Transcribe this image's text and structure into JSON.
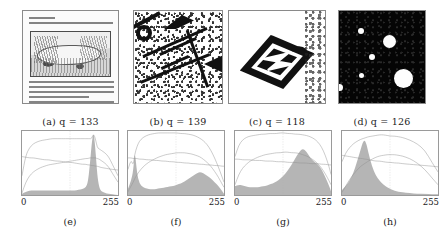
{
  "figure": {
    "axis_max_label": "255",
    "axis_min_label": "0"
  },
  "image_panels": [
    {
      "id": "a",
      "caption": "(a)  q = 133",
      "label": "(a)",
      "symbol": "q",
      "equals": "=",
      "q_value": "133",
      "content_name": "old-printed-page-with-engraving"
    },
    {
      "id": "b",
      "caption": "(b)  q = 139",
      "label": "(b)",
      "symbol": "q",
      "equals": "=",
      "q_value": "139",
      "content_name": "noisy-binarized-label-scan"
    },
    {
      "id": "c",
      "caption": "(c)  q = 118",
      "label": "(c)",
      "symbol": "q",
      "equals": "=",
      "q_value": "118",
      "content_name": "diamond-logo-on-white"
    },
    {
      "id": "d",
      "caption": "(d)  q = 126",
      "label": "(d)",
      "symbol": "q",
      "equals": "=",
      "q_value": "126",
      "content_name": "white-blobs-on-dark-background"
    }
  ],
  "hist_panels": [
    {
      "id": "e",
      "caption": "(e)",
      "x_min": "0",
      "x_max": "255"
    },
    {
      "id": "f",
      "caption": "(f)",
      "x_min": "0",
      "x_max": "255"
    },
    {
      "id": "g",
      "caption": "(g)",
      "x_min": "0",
      "x_max": "255"
    },
    {
      "id": "h",
      "caption": "(h)",
      "x_min": "0",
      "x_max": "255"
    }
  ],
  "colors": {
    "histogram_fill": "#a8a8a8",
    "curve_stroke": "#8e8e8e",
    "frame": "#9a9a9a",
    "grid": "#cfcfcf",
    "text": "#222222",
    "page_background": "#ffffff"
  },
  "chart_data": [
    {
      "type": "area",
      "id": "e",
      "title": "(e)",
      "xlabel": "",
      "ylabel": "",
      "xlim": [
        0,
        255
      ],
      "ylim": [
        0,
        1
      ],
      "grid": true,
      "legend": "none",
      "notes": "Gray-level histogram of panel (a): low flat background with a single very tall narrow spike near 190.",
      "x": [
        0,
        10,
        20,
        30,
        40,
        50,
        60,
        70,
        80,
        90,
        100,
        110,
        120,
        130,
        140,
        150,
        160,
        170,
        175,
        180,
        185,
        190,
        195,
        200,
        205,
        210,
        220,
        230,
        240,
        255
      ],
      "series": [
        {
          "name": "histogram",
          "values": [
            0.02,
            0.05,
            0.07,
            0.07,
            0.07,
            0.07,
            0.07,
            0.07,
            0.07,
            0.07,
            0.07,
            0.07,
            0.07,
            0.07,
            0.07,
            0.08,
            0.09,
            0.12,
            0.2,
            0.45,
            0.8,
            1.0,
            0.72,
            0.3,
            0.12,
            0.06,
            0.03,
            0.02,
            0.01,
            0.0
          ]
        },
        {
          "name": "upper-curve",
          "values": [
            0.3,
            0.62,
            0.74,
            0.8,
            0.83,
            0.85,
            0.86,
            0.87,
            0.88,
            0.88,
            0.88,
            0.88,
            0.88,
            0.88,
            0.88,
            0.88,
            0.88,
            0.88,
            0.88,
            0.88,
            0.88,
            0.96,
            0.88,
            0.74,
            0.72,
            0.7,
            0.66,
            0.6,
            0.48,
            0.3
          ]
        },
        {
          "name": "rising-curve",
          "values": [
            0.03,
            0.2,
            0.3,
            0.36,
            0.4,
            0.43,
            0.45,
            0.47,
            0.48,
            0.49,
            0.5,
            0.51,
            0.52,
            0.53,
            0.54,
            0.55,
            0.56,
            0.57,
            0.57,
            0.58,
            0.58,
            0.58,
            0.58,
            0.57,
            0.56,
            0.54,
            0.5,
            0.44,
            0.34,
            0.2
          ]
        },
        {
          "name": "falling-line",
          "values": [
            0.6,
            0.59,
            0.58,
            0.58,
            0.57,
            0.56,
            0.55,
            0.55,
            0.54,
            0.53,
            0.53,
            0.52,
            0.51,
            0.51,
            0.5,
            0.49,
            0.48,
            0.48,
            0.47,
            0.47,
            0.46,
            0.46,
            0.45,
            0.45,
            0.44,
            0.43,
            0.42,
            0.41,
            0.4,
            0.39
          ]
        }
      ]
    },
    {
      "type": "area",
      "id": "f",
      "title": "(f)",
      "xlabel": "",
      "ylabel": "",
      "xlim": [
        0,
        255
      ],
      "ylim": [
        0,
        1
      ],
      "grid": true,
      "legend": "none",
      "notes": "Gray-level histogram of panel (b): sharp dark spike near 18 plus a broad bump centered around 190.",
      "x": [
        0,
        8,
        14,
        18,
        24,
        30,
        40,
        50,
        60,
        70,
        80,
        90,
        100,
        110,
        120,
        130,
        140,
        150,
        160,
        170,
        180,
        190,
        200,
        210,
        220,
        230,
        240,
        250,
        255
      ],
      "series": [
        {
          "name": "histogram",
          "values": [
            0.1,
            0.22,
            0.38,
            0.7,
            0.34,
            0.18,
            0.12,
            0.1,
            0.09,
            0.09,
            0.1,
            0.11,
            0.12,
            0.13,
            0.14,
            0.16,
            0.18,
            0.21,
            0.25,
            0.29,
            0.33,
            0.36,
            0.34,
            0.3,
            0.26,
            0.2,
            0.14,
            0.06,
            0.02
          ]
        },
        {
          "name": "upper-curve",
          "values": [
            0.4,
            0.55,
            0.46,
            0.64,
            0.76,
            0.84,
            0.9,
            0.93,
            0.95,
            0.96,
            0.97,
            0.97,
            0.97,
            0.97,
            0.97,
            0.97,
            0.96,
            0.96,
            0.95,
            0.94,
            0.92,
            0.89,
            0.85,
            0.79,
            0.7,
            0.58,
            0.44,
            0.28,
            0.2
          ]
        },
        {
          "name": "rising-curve",
          "values": [
            0.05,
            0.14,
            0.2,
            0.26,
            0.32,
            0.37,
            0.44,
            0.49,
            0.53,
            0.56,
            0.59,
            0.61,
            0.63,
            0.64,
            0.65,
            0.66,
            0.66,
            0.66,
            0.65,
            0.64,
            0.62,
            0.6,
            0.56,
            0.51,
            0.45,
            0.37,
            0.28,
            0.17,
            0.12
          ]
        },
        {
          "name": "falling-line",
          "values": [
            0.58,
            0.58,
            0.57,
            0.57,
            0.57,
            0.56,
            0.56,
            0.55,
            0.55,
            0.54,
            0.54,
            0.53,
            0.53,
            0.52,
            0.52,
            0.51,
            0.51,
            0.5,
            0.5,
            0.49,
            0.49,
            0.48,
            0.48,
            0.47,
            0.47,
            0.46,
            0.46,
            0.45,
            0.45
          ]
        }
      ]
    },
    {
      "type": "area",
      "id": "g",
      "title": "(g)",
      "xlabel": "",
      "ylabel": "",
      "xlim": [
        0,
        255
      ],
      "ylim": [
        0,
        1
      ],
      "grid": true,
      "legend": "none",
      "notes": "Gray-level histogram of panel (c): low left plateau rising to a broad peak near 185.",
      "x": [
        0,
        10,
        20,
        30,
        40,
        50,
        60,
        70,
        80,
        90,
        100,
        110,
        120,
        130,
        140,
        150,
        160,
        170,
        180,
        190,
        200,
        210,
        220,
        230,
        240,
        250,
        255
      ],
      "series": [
        {
          "name": "histogram",
          "values": [
            0.14,
            0.16,
            0.15,
            0.13,
            0.12,
            0.12,
            0.12,
            0.13,
            0.14,
            0.16,
            0.18,
            0.21,
            0.25,
            0.31,
            0.38,
            0.47,
            0.57,
            0.67,
            0.73,
            0.68,
            0.58,
            0.52,
            0.48,
            0.4,
            0.28,
            0.14,
            0.06
          ]
        },
        {
          "name": "upper-curve",
          "values": [
            0.6,
            0.78,
            0.86,
            0.9,
            0.92,
            0.93,
            0.94,
            0.95,
            0.95,
            0.96,
            0.96,
            0.96,
            0.97,
            0.97,
            0.96,
            0.96,
            0.95,
            0.95,
            0.94,
            0.93,
            0.91,
            0.88,
            0.83,
            0.75,
            0.62,
            0.44,
            0.32
          ]
        },
        {
          "name": "rising-curve",
          "values": [
            0.16,
            0.32,
            0.42,
            0.48,
            0.53,
            0.56,
            0.59,
            0.61,
            0.63,
            0.64,
            0.65,
            0.66,
            0.66,
            0.67,
            0.67,
            0.66,
            0.66,
            0.65,
            0.63,
            0.61,
            0.58,
            0.54,
            0.49,
            0.42,
            0.33,
            0.22,
            0.16
          ]
        },
        {
          "name": "falling-line",
          "values": [
            0.56,
            0.56,
            0.55,
            0.55,
            0.55,
            0.54,
            0.54,
            0.54,
            0.53,
            0.53,
            0.53,
            0.52,
            0.52,
            0.52,
            0.51,
            0.51,
            0.51,
            0.5,
            0.5,
            0.5,
            0.49,
            0.49,
            0.49,
            0.48,
            0.48,
            0.47,
            0.47
          ]
        }
      ]
    },
    {
      "type": "area",
      "id": "h",
      "title": "(h)",
      "xlabel": "",
      "ylabel": "",
      "xlim": [
        0,
        255
      ],
      "ylim": [
        0,
        1
      ],
      "grid": true,
      "legend": "none",
      "notes": "Gray-level histogram of panel (d): single strong peak near 60 falling off to near zero above 150.",
      "x": [
        0,
        10,
        20,
        30,
        40,
        50,
        55,
        60,
        65,
        70,
        80,
        90,
        100,
        110,
        120,
        130,
        140,
        150,
        160,
        180,
        200,
        220,
        240,
        255
      ],
      "series": [
        {
          "name": "histogram",
          "values": [
            0.08,
            0.14,
            0.22,
            0.34,
            0.52,
            0.72,
            0.82,
            0.86,
            0.8,
            0.66,
            0.44,
            0.3,
            0.22,
            0.16,
            0.12,
            0.09,
            0.07,
            0.05,
            0.04,
            0.03,
            0.02,
            0.02,
            0.01,
            0.01
          ]
        },
        {
          "name": "upper-curve",
          "values": [
            0.52,
            0.66,
            0.74,
            0.8,
            0.84,
            0.87,
            0.88,
            0.89,
            0.9,
            0.91,
            0.92,
            0.93,
            0.94,
            0.94,
            0.93,
            0.92,
            0.92,
            0.91,
            0.9,
            0.86,
            0.8,
            0.7,
            0.5,
            0.36
          ]
        },
        {
          "name": "rising-curve",
          "values": [
            0.04,
            0.14,
            0.24,
            0.32,
            0.39,
            0.45,
            0.47,
            0.49,
            0.51,
            0.53,
            0.56,
            0.59,
            0.61,
            0.62,
            0.63,
            0.63,
            0.63,
            0.62,
            0.61,
            0.57,
            0.5,
            0.4,
            0.26,
            0.16
          ]
        },
        {
          "name": "falling-line",
          "values": [
            0.62,
            0.61,
            0.6,
            0.59,
            0.58,
            0.57,
            0.57,
            0.56,
            0.56,
            0.55,
            0.54,
            0.53,
            0.53,
            0.52,
            0.51,
            0.51,
            0.5,
            0.5,
            0.49,
            0.48,
            0.47,
            0.46,
            0.45,
            0.44
          ]
        }
      ]
    }
  ]
}
